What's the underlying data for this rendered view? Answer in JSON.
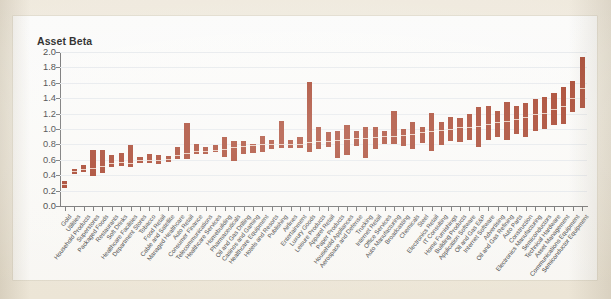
{
  "page": {
    "background_color": "#efe9dc",
    "panel_color": "#fbfbfa"
  },
  "chart_data": {
    "type": "bar",
    "subtype": "floating-range-bars",
    "title": "Asset Beta",
    "xlabel": "",
    "ylabel": "Asset Beta",
    "ylim": [
      0.0,
      2.0
    ],
    "ytick_labels": [
      "0.0",
      "0.2",
      "0.4",
      "0.6",
      "0.8",
      "1.0",
      "1.2",
      "1.4",
      "1.6",
      "1.8",
      "2.0"
    ],
    "ytick_values": [
      0.0,
      0.2,
      0.4,
      0.6,
      0.8,
      1.0,
      1.2,
      1.4,
      1.6,
      1.8,
      2.0
    ],
    "grid": true,
    "legend": "none",
    "bar_color": "#a33a22",
    "median_color": "#e8c9ba",
    "categories": [
      "Gold",
      "Utilities",
      "Household Products",
      "Superstores",
      "Packaged Foods",
      "Restaurants",
      "Soft Drinks",
      "Healthcare Facilities",
      "Department Stores",
      "Tobacco",
      "Food Retail",
      "Cable and Satellite",
      "Managed Healthcare",
      "Auto Retail",
      "Consumer Finance",
      "Telecommunications",
      "Healthcare Services",
      "Homebuilding",
      "Pharmaceuticals",
      "Oil and Gas Drilling",
      "Casinos and Gaming",
      "Healthcare Equipment",
      "Hotels and Resorts",
      "Publishing",
      "Airlines",
      "Entertainment",
      "Luxury Goods",
      "Leisure Products",
      "Apparel Retail",
      "Paper Products",
      "Household Appliances",
      "Aerospace and Defense",
      "Trucking",
      "Internet Retail",
      "Office Services",
      "Auto Manufacturing",
      "Broadcasting",
      "Chemicals",
      "Steel",
      "Electronics Retail",
      "IT Consulting",
      "Home Furnishings",
      "Building Products",
      "Application Software",
      "Oil and Gas E&P",
      "Internet Software",
      "Advertising",
      "Oil and Gas Refining",
      "Auto Parts",
      "Construction",
      "Electronics Manufacturing",
      "Semiconductors",
      "Technical Hardware",
      "Asset Management",
      "Communications Equipment",
      "Semiconductor Equipment"
    ],
    "series": [
      {
        "name": "Asset Beta range (low / median / high)",
        "low": [
          0.23,
          0.42,
          0.44,
          0.39,
          0.43,
          0.51,
          0.52,
          0.5,
          0.56,
          0.56,
          0.54,
          0.57,
          0.61,
          0.61,
          0.67,
          0.68,
          0.7,
          0.63,
          0.59,
          0.68,
          0.69,
          0.7,
          0.74,
          0.75,
          0.75,
          0.75,
          0.7,
          0.74,
          0.76,
          0.62,
          0.66,
          0.78,
          0.62,
          0.74,
          0.8,
          0.8,
          0.78,
          0.74,
          0.82,
          0.72,
          0.79,
          0.85,
          0.83,
          0.86,
          0.76,
          0.86,
          0.9,
          0.86,
          0.94,
          0.9,
          0.97,
          1.0,
          1.05,
          1.06,
          1.22,
          1.27
        ],
        "median": [
          0.28,
          0.45,
          0.48,
          0.49,
          0.52,
          0.56,
          0.57,
          0.56,
          0.6,
          0.6,
          0.6,
          0.61,
          0.66,
          0.69,
          0.72,
          0.72,
          0.73,
          0.74,
          0.76,
          0.78,
          0.79,
          0.8,
          0.8,
          0.8,
          0.8,
          0.8,
          0.83,
          0.84,
          0.85,
          0.86,
          0.87,
          0.88,
          0.88,
          0.89,
          0.91,
          0.91,
          0.92,
          0.93,
          0.96,
          0.97,
          0.99,
          1.0,
          1.02,
          1.03,
          1.04,
          1.07,
          1.09,
          1.11,
          1.13,
          1.15,
          1.19,
          1.21,
          1.26,
          1.3,
          1.4,
          1.53
        ],
        "high": [
          0.32,
          0.48,
          0.53,
          0.73,
          0.73,
          0.66,
          0.69,
          0.79,
          0.63,
          0.68,
          0.66,
          0.65,
          0.76,
          1.08,
          0.8,
          0.76,
          0.79,
          0.9,
          0.85,
          0.84,
          0.81,
          0.91,
          0.86,
          1.11,
          0.86,
          0.9,
          1.61,
          1.03,
          0.96,
          0.97,
          1.05,
          0.97,
          1.03,
          1.02,
          0.98,
          1.23,
          1.0,
          1.09,
          1.03,
          1.21,
          1.09,
          1.16,
          1.14,
          1.2,
          1.28,
          1.3,
          1.23,
          1.35,
          1.3,
          1.34,
          1.39,
          1.42,
          1.47,
          1.55,
          1.62,
          1.93
        ]
      }
    ]
  }
}
